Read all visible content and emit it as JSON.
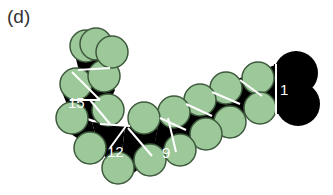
{
  "figure": {
    "panel_label": "(d)",
    "unit_labels": {
      "first": "1",
      "ninth": "9",
      "twelfth": "12",
      "fifteenth": "15"
    },
    "colors": {
      "sphere_fill": "#9cc89a",
      "sphere_stroke": "#3e5a3c",
      "core": "#000000",
      "divider": "#ffffff",
      "background": "#ffffff"
    }
  }
}
